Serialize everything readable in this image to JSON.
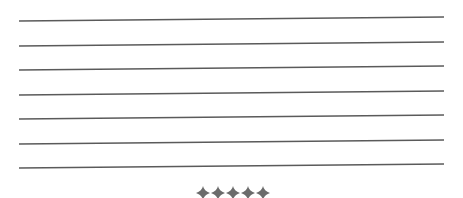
{
  "page": {
    "kind": "ruled-writing-area"
  },
  "ruled_lines": {
    "count": 7,
    "color": "#5a5a5a",
    "thickness": 1.3,
    "left_x": 19,
    "right_x": 444,
    "left_y": [
      21,
      46,
      70,
      95,
      119,
      144,
      168
    ],
    "right_y": [
      17,
      42,
      66,
      91,
      115,
      140,
      164
    ],
    "lines": [
      {
        "text": ""
      },
      {
        "text": ""
      },
      {
        "text": ""
      },
      {
        "text": ""
      },
      {
        "text": ""
      },
      {
        "text": ""
      },
      {
        "text": ""
      }
    ]
  },
  "divider": {
    "icon": "four-point-star-diamond-icon",
    "count": 5,
    "color": "#6b6b6b",
    "label": "◆◆◆◆◆"
  }
}
